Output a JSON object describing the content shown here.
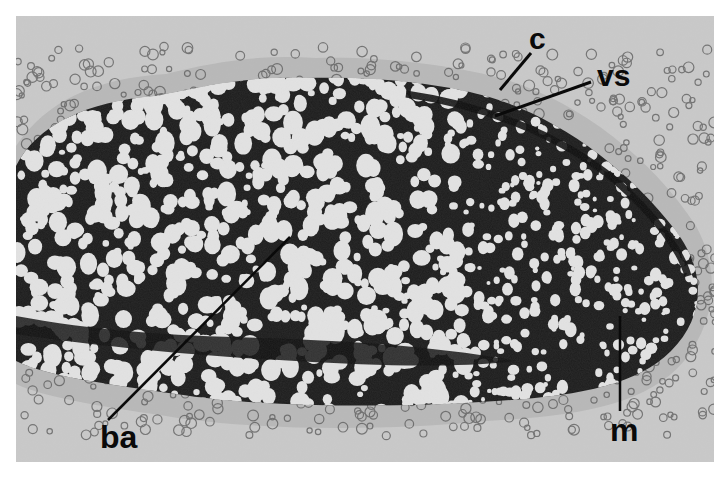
{
  "figure": {
    "background_color": "#c9c9c9",
    "tissue_dark_color": "#1c1c1c",
    "cell_color": "#e6e6e6"
  },
  "labels": [
    {
      "id": "c",
      "text": "c"
    },
    {
      "id": "vs",
      "text": "vs"
    },
    {
      "id": "ba",
      "text": "ba"
    },
    {
      "id": "m",
      "text": "m"
    }
  ]
}
